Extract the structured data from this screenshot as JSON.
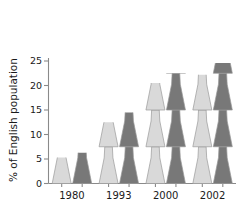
{
  "chart_data": {
    "type": "bar",
    "title": "",
    "subtitle": "",
    "xlabel": "",
    "ylabel": "% of English population",
    "categories": [
      "1980",
      "1993",
      "2000",
      "2002"
    ],
    "ylim": [
      0,
      25
    ],
    "yticks": [
      0,
      5,
      10,
      15,
      20,
      25
    ],
    "ytick_labels": [
      "0",
      "5",
      "10",
      "15",
      "20",
      "25"
    ],
    "grid": false,
    "legend": "none",
    "pictogram": true,
    "pictogram_unit_value": 7.5,
    "series": [
      {
        "name": "light",
        "color": "#d9d9d9",
        "values": [
          5.3,
          12.5,
          20.5,
          22.2
        ]
      },
      {
        "name": "dark",
        "color": "#787878",
        "values": [
          6.3,
          14.5,
          22.5,
          24.6
        ]
      }
    ]
  },
  "colors": {
    "background": "#ffffff",
    "axis": "#8a8a8a",
    "text": "#1a1a1a",
    "series_light": "#d9d9d9",
    "series_dark": "#787878",
    "figure_outline": "#9a9a9a"
  }
}
